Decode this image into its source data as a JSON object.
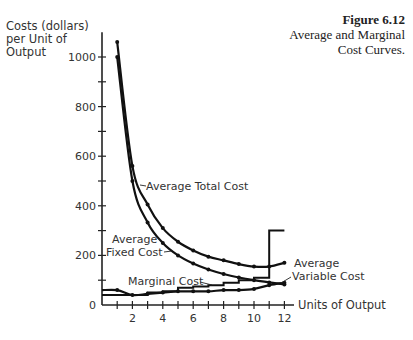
{
  "figure": {
    "number": "Figure 6.12",
    "title_line1": "Average and Marginal",
    "title_line2": "Cost Curves."
  },
  "axes": {
    "ylabel_line1": "Costs (dollars)",
    "ylabel_line2": "per Unit of",
    "ylabel_line3": "Output",
    "xlabel": "Units of Output"
  },
  "chart_data": {
    "type": "line",
    "title": "Figure 6.12 Average and Marginal Cost Curves.",
    "xlabel": "Units of Output",
    "ylabel": "Costs (dollars) per Unit of Output",
    "xlim": [
      0,
      12.5
    ],
    "ylim": [
      0,
      1100
    ],
    "x_ticks": [
      1,
      2,
      3,
      4,
      5,
      6,
      7,
      8,
      9,
      10,
      11,
      12
    ],
    "x_tick_labels": [
      "2",
      "4",
      "6",
      "8",
      "10",
      "12"
    ],
    "y_ticks": [
      0,
      100,
      200,
      300,
      400,
      500,
      600,
      700,
      800,
      900,
      1000
    ],
    "y_tick_labels": [
      "0",
      "200",
      "400",
      "600",
      "800",
      "1000"
    ],
    "grid": false,
    "legend": "inline labels",
    "x": [
      1,
      2,
      3,
      4,
      5,
      6,
      7,
      8,
      9,
      10,
      11,
      12
    ],
    "series": [
      {
        "name": "Average Total Cost",
        "values": [
          1060,
          560,
          405,
          310,
          255,
          220,
          195,
          180,
          165,
          155,
          155,
          170
        ]
      },
      {
        "name": "Average Fixed Cost",
        "values": [
          1000,
          500,
          333,
          250,
          200,
          167,
          143,
          125,
          111,
          100,
          91,
          83
        ]
      },
      {
        "name": "Average Variable Cost",
        "values": [
          60,
          40,
          45,
          50,
          55,
          55,
          55,
          60,
          60,
          65,
          80,
          90
        ]
      },
      {
        "name": "Marginal Cost",
        "type": "step",
        "values": [
          40,
          40,
          50,
          55,
          70,
          75,
          80,
          90,
          100,
          110,
          300,
          300
        ]
      }
    ]
  }
}
